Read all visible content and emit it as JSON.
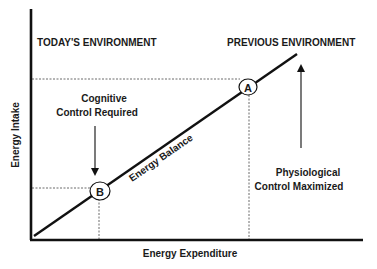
{
  "diagram": {
    "axes": {
      "x_label": "Energy Expenditure",
      "y_label": "Energy Intake"
    },
    "regions": {
      "left_title": "TODAY'S ENVIRONMENT",
      "right_title": "PREVIOUS ENVIRONMENT"
    },
    "line": {
      "label": "Energy Balance"
    },
    "points": [
      {
        "id": "A",
        "label": "A"
      },
      {
        "id": "B",
        "label": "B"
      }
    ],
    "annotations": {
      "cognitive_line1": "Cognitive",
      "cognitive_line2": "Control Required",
      "physiological_line1": "Physiological",
      "physiological_line2": "Control Maximized"
    },
    "colors": {
      "foreground": "#111111",
      "background": "#ffffff"
    }
  }
}
